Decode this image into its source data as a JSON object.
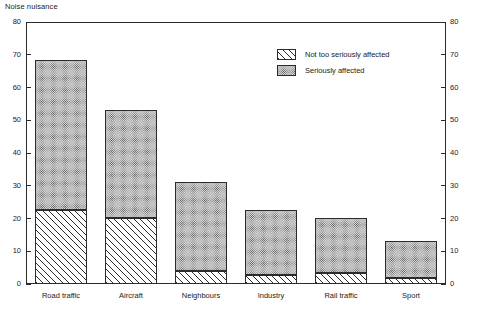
{
  "chart_data": {
    "type": "bar",
    "subtype": "stacked-vertical",
    "title": "Noise nuisance",
    "xlabel": "",
    "ylabel": "",
    "ylim": [
      0,
      80
    ],
    "yticks": [
      0,
      10,
      20,
      30,
      40,
      50,
      60,
      70,
      80
    ],
    "ytick_labels": [
      "0",
      "10",
      "20",
      "30",
      "40",
      "50",
      "60",
      "70",
      "80"
    ],
    "right_axis": {
      "visible": true,
      "ylim": [
        0,
        80
      ],
      "yticks": [
        0,
        10,
        20,
        30,
        40,
        50,
        60,
        70,
        80
      ],
      "ytick_labels": [
        "0",
        "10",
        "20",
        "30",
        "40",
        "50",
        "60",
        "70",
        "80"
      ]
    },
    "grid": false,
    "legend_position": "upper-right-inside",
    "categories": [
      "Road traffic",
      "Aircraft",
      "Neighbours",
      "Industry",
      "Rail traffic",
      "Sport"
    ],
    "series": [
      {
        "name": "Not too seriously affected",
        "pattern": "diagonal-hatch",
        "color": "#ffffff",
        "values": [
          22.5,
          20.0,
          4.0,
          2.8,
          3.3,
          1.7
        ]
      },
      {
        "name": "Seriously affected",
        "pattern": "dotted-grey",
        "color": "#d2d2d2",
        "values": [
          46.0,
          33.0,
          27.2,
          19.7,
          16.8,
          11.3
        ]
      }
    ],
    "totals": [
      68.5,
      53.0,
      31.2,
      22.5,
      20.1,
      13.0
    ]
  },
  "legend": {
    "items": [
      {
        "label": "Not too seriously affected",
        "pattern": "diagonal-hatch"
      },
      {
        "label": "Seriously affected",
        "pattern": "dotted-grey"
      }
    ]
  },
  "colors": {
    "axis": "#2b2b2b",
    "hatch_line": "#2b2b2b",
    "dot_fill": "#d2d2d2",
    "background": "#ffffff"
  }
}
